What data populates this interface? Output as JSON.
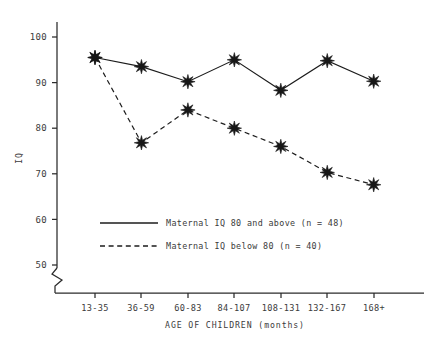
{
  "chart_data": {
    "type": "line",
    "title": "",
    "xlabel": "AGE OF CHILDREN (months)",
    "ylabel": "IQ",
    "categories": [
      "13-35",
      "36-59",
      "60-83",
      "84-107",
      "108-131",
      "132-167",
      "168+"
    ],
    "ylim": [
      50,
      100
    ],
    "yticks": [
      50,
      60,
      70,
      80,
      90,
      100
    ],
    "ytick_labels": [
      "50",
      "60",
      "70",
      "80",
      "90",
      "100"
    ],
    "axis_break": true,
    "grid": false,
    "legend_position": "inside-lower-left",
    "series": [
      {
        "name": "Maternal IQ 80 and above (n = 48)",
        "style": "solid",
        "marker": "asterisk",
        "values": [
          95.5,
          93.5,
          90.2,
          95.0,
          88.3,
          94.8,
          90.3
        ]
      },
      {
        "name": "Maternal IQ below 80 (n = 40)",
        "style": "dashed",
        "marker": "asterisk",
        "values": [
          95.5,
          76.8,
          84.0,
          80.0,
          76.0,
          70.3,
          67.6
        ]
      }
    ]
  },
  "legend": {
    "entries": [
      {
        "label": "Maternal IQ 80 and above (n = 48)",
        "style": "solid"
      },
      {
        "label": "Maternal IQ below 80 (n = 40)",
        "style": "dashed"
      }
    ]
  },
  "axes": {
    "y_title": "IQ",
    "x_title": "AGE OF CHILDREN (months)"
  },
  "colors": {
    "ink": "#1c1c1c",
    "text": "#3b3b3b",
    "background": "#ffffff"
  }
}
